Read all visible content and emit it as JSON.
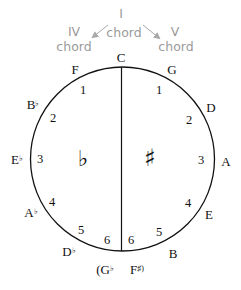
{
  "annotations": {
    "i_chord": {
      "line1": "I",
      "line2": "chord"
    },
    "iv_chord": {
      "line1": "IV",
      "line2": "chord"
    },
    "v_chord": {
      "line1": "V",
      "line2": "chord"
    },
    "color": "#9a9a9a"
  },
  "top_key": "C",
  "flat_side": {
    "symbol": "♭",
    "keys": [
      {
        "name": "F",
        "acc": "",
        "count": "1"
      },
      {
        "name": "B",
        "acc": "♭",
        "count": "2"
      },
      {
        "name": "E",
        "acc": "♭",
        "count": "3"
      },
      {
        "name": "A",
        "acc": "♭",
        "count": "4"
      },
      {
        "name": "D",
        "acc": "♭",
        "count": "5"
      },
      {
        "name": "(G",
        "acc": "♭",
        "count": "6"
      }
    ]
  },
  "sharp_side": {
    "symbol": "♯",
    "keys": [
      {
        "name": "G",
        "acc": "",
        "count": "1"
      },
      {
        "name": "D",
        "acc": "",
        "count": "2"
      },
      {
        "name": "A",
        "acc": "",
        "count": "3"
      },
      {
        "name": "E",
        "acc": "",
        "count": "4"
      },
      {
        "name": "B",
        "acc": "",
        "count": "5"
      },
      {
        "name": "F",
        "acc": "♯)",
        "count": "6"
      }
    ]
  },
  "colors": {
    "line": "#111111",
    "text": "#111111"
  }
}
